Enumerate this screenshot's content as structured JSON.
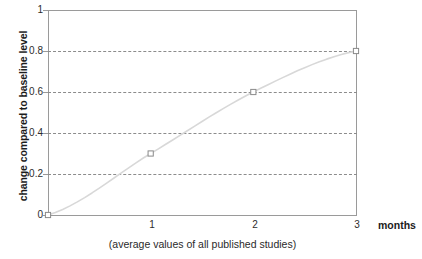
{
  "chart_data": {
    "type": "line",
    "title": "",
    "subtitle": "(average values of all published studies)",
    "xlabel": "months",
    "ylabel": "change compared to baseline level",
    "x": [
      0,
      1,
      2,
      3
    ],
    "values": [
      0,
      0.3,
      0.6,
      0.8
    ],
    "series": [
      {
        "name": "average change",
        "x": [
          0,
          1,
          2,
          3
        ],
        "values": [
          0,
          0.3,
          0.6,
          0.8
        ]
      }
    ],
    "xlim": [
      0,
      3
    ],
    "ylim": [
      0,
      1
    ],
    "xticks": [
      0,
      1,
      2,
      3
    ],
    "xticklabels": [
      "",
      "1",
      "2",
      "3"
    ],
    "yticks": [
      0,
      0.2,
      0.4,
      0.6,
      0.8,
      1
    ],
    "yticklabels": [
      "0",
      "0.2",
      "0.4",
      "0.6",
      "0.8",
      "1"
    ],
    "gridlines_y": [
      0.2,
      0.4,
      0.6,
      0.8
    ],
    "grid": "horizontal-dashed",
    "legend": "none",
    "marker": "open-square",
    "line_color": "#d8d8d8",
    "marker_color": "#8a8a8a",
    "grid_color": "#8c8c8c",
    "axis_color": "#9a9a9a",
    "text_color": "#2a2a2a",
    "background": "#ffffff"
  },
  "axes": {
    "y_title": "change compared to baseline level",
    "x_unit": "months",
    "caption": "(average values of all published studies)",
    "y_tick_labels": [
      "1",
      "0.8",
      "0.6",
      "0.4",
      "0.2",
      "0"
    ],
    "x_tick_labels": [
      "1",
      "2",
      "3"
    ]
  }
}
